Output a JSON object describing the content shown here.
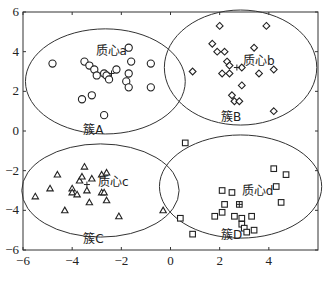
{
  "chart_data": {
    "type": "scatter",
    "title": "",
    "xlabel": "",
    "ylabel": "",
    "xlim": [
      -6,
      6
    ],
    "ylim": [
      -6,
      6
    ],
    "xticks": [
      -6,
      -4,
      -2,
      0,
      2,
      4
    ],
    "yticks": [
      -6,
      -4,
      -2,
      0,
      2,
      4,
      6
    ],
    "grid": false,
    "legend": null,
    "series": [
      {
        "name": "簇A",
        "marker": "circle",
        "centroid_label": "质心a",
        "centroid": [
          -2.4,
          2.9
        ],
        "ellipse": {
          "cx": -2.65,
          "cy": 2.5,
          "rx": 3.25,
          "ry": 2.65
        },
        "points": [
          [
            -4.8,
            3.4
          ],
          [
            -3.5,
            3.5
          ],
          [
            -3.3,
            3.3
          ],
          [
            -3.1,
            3.1
          ],
          [
            -3.0,
            2.8
          ],
          [
            -2.7,
            2.9
          ],
          [
            -2.6,
            2.8
          ],
          [
            -2.5,
            2.6
          ],
          [
            -2.2,
            3.1
          ],
          [
            -1.7,
            4.2
          ],
          [
            -1.6,
            3.5
          ],
          [
            -1.7,
            2.9
          ],
          [
            -1.8,
            2.5
          ],
          [
            -1.7,
            2.2
          ],
          [
            -0.8,
            3.4
          ],
          [
            -0.8,
            2.2
          ],
          [
            -3.6,
            1.6
          ],
          [
            -3.2,
            1.8
          ],
          [
            -2.7,
            0.8
          ]
        ]
      },
      {
        "name": "簇B",
        "marker": "diamond",
        "centroid_label": "质心b",
        "centroid": [
          2.7,
          3.2
        ],
        "ellipse": {
          "cx": 2.85,
          "cy": 3.2,
          "rx": 3.1,
          "ry": 2.9
        },
        "points": [
          [
            2.0,
            5.3
          ],
          [
            3.9,
            5.3
          ],
          [
            1.7,
            4.4
          ],
          [
            1.9,
            4.0
          ],
          [
            2.2,
            4.0
          ],
          [
            3.4,
            4.2
          ],
          [
            2.3,
            3.5
          ],
          [
            2.4,
            3.3
          ],
          [
            2.9,
            3.2
          ],
          [
            0.9,
            3.0
          ],
          [
            2.1,
            2.9
          ],
          [
            2.4,
            2.9
          ],
          [
            3.6,
            2.9
          ],
          [
            4.2,
            3.1
          ],
          [
            2.9,
            2.3
          ],
          [
            2.5,
            1.8
          ],
          [
            2.6,
            1.5
          ],
          [
            2.8,
            1.5
          ],
          [
            4.2,
            1.0
          ]
        ]
      },
      {
        "name": "簇C",
        "marker": "triangle",
        "centroid_label": "质心c",
        "centroid": [
          -3.4,
          -2.7
        ],
        "ellipse": {
          "cx": -2.85,
          "cy": -3.0,
          "rx": 3.2,
          "ry": 2.35
        },
        "points": [
          [
            -3.5,
            -1.8
          ],
          [
            -4.6,
            -2.2
          ],
          [
            -3.7,
            -2.5
          ],
          [
            -3.6,
            -2.3
          ],
          [
            -3.2,
            -2.4
          ],
          [
            -2.8,
            -2.2
          ],
          [
            -2.6,
            -2.1
          ],
          [
            -4.9,
            -2.9
          ],
          [
            -4.0,
            -2.9
          ],
          [
            -4.0,
            -3.1
          ],
          [
            -3.8,
            -3.2
          ],
          [
            -5.5,
            -3.3
          ],
          [
            -3.4,
            -3.0
          ],
          [
            -2.8,
            -3.1
          ],
          [
            -2.7,
            -3.1
          ],
          [
            -3.3,
            -3.6
          ],
          [
            -2.6,
            -3.5
          ],
          [
            -4.3,
            -4.0
          ],
          [
            -2.1,
            -4.3
          ],
          [
            -0.3,
            -4.0
          ]
        ]
      },
      {
        "name": "簇D",
        "marker": "square",
        "centroid_label": "质心d",
        "centroid": [
          2.8,
          -3.7
        ],
        "ellipse": {
          "cx": 2.85,
          "cy": -2.8,
          "rx": 3.3,
          "ry": 2.6
        },
        "points": [
          [
            0.6,
            -0.6
          ],
          [
            4.2,
            -1.9
          ],
          [
            4.7,
            -2.2
          ],
          [
            4.3,
            -2.8
          ],
          [
            4.5,
            -3.6
          ],
          [
            2.1,
            -3.0
          ],
          [
            2.5,
            -3.1
          ],
          [
            2.2,
            -3.7
          ],
          [
            2.8,
            -3.7
          ],
          [
            1.8,
            -4.3
          ],
          [
            2.1,
            -4.1
          ],
          [
            2.6,
            -4.3
          ],
          [
            2.9,
            -4.4
          ],
          [
            3.3,
            -4.3
          ],
          [
            2.9,
            -4.7
          ],
          [
            3.0,
            -4.9
          ],
          [
            3.1,
            -5.1
          ],
          [
            3.4,
            -5.0
          ],
          [
            0.4,
            -4.4
          ],
          [
            0.9,
            -5.2
          ]
        ]
      }
    ],
    "annotations": [
      {
        "text": "质心a",
        "x": -3.05,
        "y": 3.85
      },
      {
        "text": "质心b",
        "x": 2.95,
        "y": 3.35
      },
      {
        "text": "质心c",
        "x": -2.95,
        "y": -2.75
      },
      {
        "text": "质心d",
        "x": 2.9,
        "y": -3.25
      },
      {
        "text": "簇A",
        "x": -3.55,
        "y": -0.15
      },
      {
        "text": "簇B",
        "x": 2.05,
        "y": 0.5
      },
      {
        "text": "簇C",
        "x": -3.55,
        "y": -5.65
      },
      {
        "text": "簇D",
        "x": 2.05,
        "y": -5.45
      }
    ]
  }
}
